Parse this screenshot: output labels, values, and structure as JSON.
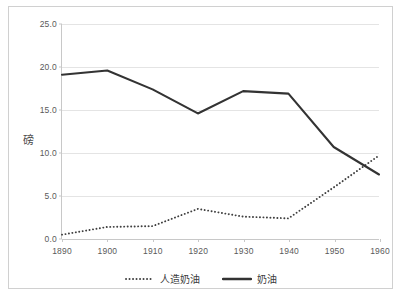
{
  "chart_data": {
    "type": "line",
    "title": "",
    "xlabel": "",
    "ylabel": "磅",
    "x": [
      1890,
      1900,
      1910,
      1920,
      1930,
      1940,
      1950,
      1960
    ],
    "xtick_labels": [
      "1890",
      "1900",
      "1910",
      "1920",
      "1930",
      "1940",
      "1950",
      "1960"
    ],
    "ytick_labels": [
      "0.0",
      "5.0",
      "10.0",
      "15.0",
      "20.0",
      "25.0"
    ],
    "ytick_values": [
      0.0,
      5.0,
      10.0,
      15.0,
      20.0,
      25.0
    ],
    "ylim": [
      0,
      25
    ],
    "xlim": [
      1890,
      1960
    ],
    "grid": "horizontal",
    "legend_position": "bottom-center",
    "series": [
      {
        "name": "人造奶油",
        "style": "dotted",
        "color": "#404040",
        "values": [
          0.5,
          1.4,
          1.5,
          3.5,
          2.6,
          2.4,
          6.0,
          9.7
        ]
      },
      {
        "name": "奶油",
        "style": "solid",
        "color": "#333333",
        "values": [
          19.1,
          19.6,
          17.4,
          14.6,
          17.2,
          16.9,
          10.7,
          7.5
        ]
      }
    ]
  },
  "legend": {
    "items": [
      {
        "label": "人造奶油",
        "style": "dotted"
      },
      {
        "label": "奶油",
        "style": "solid"
      }
    ]
  },
  "colors": {
    "border": "#d0d0d0",
    "gridline": "#e4e4e4",
    "axis": "#c8c8c8",
    "tick_text": "#5a5a5a",
    "series_margarine": "#404040",
    "series_butter": "#333333",
    "background": "#ffffff"
  }
}
